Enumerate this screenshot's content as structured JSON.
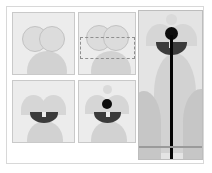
{
  "figure": {
    "title": "",
    "panel_count": 5,
    "background_color": "#ffffff",
    "frame_color": "#d8d8d8",
    "panel_fill": "#ececec",
    "panel_border": "#c9c9c9",
    "accent_dark": "#0d0d0d",
    "accent_mask": "#3b3b3b",
    "shape_light": "#dcdcdc",
    "shape_mid": "#d2d2d2",
    "shape_shadow": "#c6c6c6"
  },
  "panels": [
    {
      "id": "panel-1",
      "label": "",
      "caption": "",
      "role": "two-overlapping-circles",
      "elements": [
        {
          "name": "circle-left",
          "kind": "circle-outline"
        },
        {
          "name": "circle-right",
          "kind": "circle-outline"
        },
        {
          "name": "background-blob",
          "kind": "blob"
        }
      ]
    },
    {
      "id": "panel-2",
      "label": "",
      "caption": "",
      "role": "circles-with-bounding-box",
      "elements": [
        {
          "name": "circle-left",
          "kind": "circle-outline"
        },
        {
          "name": "circle-right",
          "kind": "circle-outline"
        },
        {
          "name": "bounding-box",
          "kind": "dashed-box"
        },
        {
          "name": "background-blob",
          "kind": "blob"
        }
      ]
    },
    {
      "id": "panel-3",
      "label": "",
      "caption": "",
      "role": "merged-shape-with-mask",
      "elements": [
        {
          "name": "dome-left",
          "kind": "dome"
        },
        {
          "name": "dome-right",
          "kind": "dome"
        },
        {
          "name": "mask-bar",
          "kind": "mask-bar"
        },
        {
          "name": "background-blob",
          "kind": "blob"
        }
      ]
    },
    {
      "id": "panel-4",
      "label": "",
      "caption": "",
      "role": "masked-shape-with-marker-dot",
      "elements": [
        {
          "name": "top-dot",
          "kind": "dot-light"
        },
        {
          "name": "dome-left",
          "kind": "dome"
        },
        {
          "name": "dome-right",
          "kind": "dome"
        },
        {
          "name": "marker-dot",
          "kind": "dot-black"
        },
        {
          "name": "mask-bar",
          "kind": "mask-bar"
        },
        {
          "name": "background-blob",
          "kind": "blob"
        }
      ]
    },
    {
      "id": "panel-5",
      "label": "",
      "caption": "",
      "role": "final-composite-with-vertical-axis",
      "elements": [
        {
          "name": "top-dot",
          "kind": "dot-light"
        },
        {
          "name": "dome-left",
          "kind": "dome"
        },
        {
          "name": "dome-right",
          "kind": "dome"
        },
        {
          "name": "marker-dot",
          "kind": "dot-black"
        },
        {
          "name": "mask-bar",
          "kind": "mask-bar"
        },
        {
          "name": "body-blob",
          "kind": "blob"
        },
        {
          "name": "side-blob-left",
          "kind": "blob-dark"
        },
        {
          "name": "side-blob-right",
          "kind": "blob-dark"
        },
        {
          "name": "vertical-line",
          "kind": "vline"
        },
        {
          "name": "ground-line",
          "kind": "hline"
        }
      ]
    }
  ]
}
